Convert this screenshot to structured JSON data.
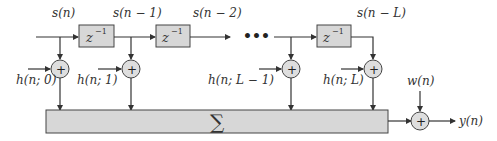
{
  "diagram": {
    "type": "tapped-delay-line / FIR channel block diagram",
    "signals": {
      "s0": "s(n)",
      "s1": "s(n − 1)",
      "s2": "s(n − 2)",
      "sL": "s(n − L)",
      "noise": "w(n)",
      "output": "y(n)"
    },
    "delay_block": {
      "base": "z",
      "exp": "−1"
    },
    "taps": {
      "h0": "h(n; 0)",
      "h1": "h(n; 1)",
      "hLm1": "h(n; L − 1)",
      "hL": "h(n; L)"
    },
    "adder_symbol": "+",
    "sum_symbol": "∑",
    "ellipsis": "•••",
    "colors": {
      "block_fill": "#d7d7d7",
      "stroke": "#333333"
    }
  }
}
